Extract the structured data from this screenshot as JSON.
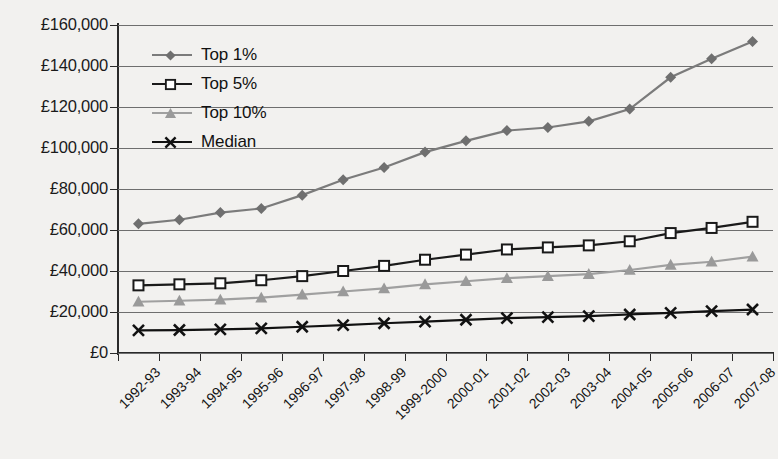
{
  "chart_data": {
    "type": "line",
    "title": "",
    "xlabel": "",
    "ylabel": "",
    "ylim": [
      0,
      160000
    ],
    "ytick_step": 20000,
    "currency_symbol": "£",
    "grid": true,
    "legend_position": "top-left-inside",
    "categories": [
      "1992-93",
      "1993-94",
      "1994-95",
      "1995-96",
      "1996-97",
      "1997-98",
      "1998-99",
      "1999-2000",
      "2000-01",
      "2001-02",
      "2002-03",
      "2003-04",
      "2004-05",
      "2005-06",
      "2006-07",
      "2007-08"
    ],
    "ytick_labels": [
      "£0",
      "£20,000",
      "£40,000",
      "£60,000",
      "£80,000",
      "£100,000",
      "£120,000",
      "£140,000",
      "£160,000"
    ],
    "ytick_values": [
      0,
      20000,
      40000,
      60000,
      80000,
      100000,
      120000,
      140000,
      160000
    ],
    "series": [
      {
        "name": "Top 1%",
        "color": "#7b7b7b",
        "marker": "diamond",
        "marker_fill": "#6f6f6f",
        "values": [
          63000,
          65000,
          68500,
          70500,
          77000,
          84500,
          90500,
          98000,
          103500,
          108500,
          110000,
          113000,
          119000,
          134500,
          143500,
          152000
        ]
      },
      {
        "name": "Top 5%",
        "color": "#1a1a1a",
        "marker": "square-open",
        "marker_fill": "#ffffff",
        "values": [
          33000,
          33500,
          34000,
          35500,
          37500,
          40000,
          42500,
          45500,
          48000,
          50500,
          51500,
          52500,
          54500,
          58500,
          61000,
          64000
        ]
      },
      {
        "name": "Top 10%",
        "color": "#a0a0a0",
        "marker": "triangle",
        "marker_fill": "#9a9a9a",
        "values": [
          25000,
          25500,
          26000,
          27000,
          28500,
          30000,
          31500,
          33500,
          35000,
          36500,
          37500,
          38500,
          40500,
          43000,
          44500,
          47000
        ]
      },
      {
        "name": "Median",
        "color": "#111111",
        "marker": "x",
        "marker_fill": "#111111",
        "values": [
          11000,
          11200,
          11500,
          12000,
          12800,
          13600,
          14500,
          15300,
          16200,
          17000,
          17500,
          18000,
          18800,
          19600,
          20400,
          21200
        ]
      }
    ]
  }
}
